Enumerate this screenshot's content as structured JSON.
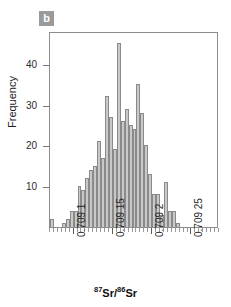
{
  "panel": {
    "letter": "b",
    "badge_color": "#9a9a9a"
  },
  "chart_data": {
    "type": "bar",
    "title": "",
    "subtitle": "",
    "xlabel": "87Sr/86Sr",
    "xlabel_parts": {
      "sup1": "87",
      "base1": "Sr/",
      "sup2": "86",
      "base2": "Sr"
    },
    "ylabel": "Frequency",
    "ylim": [
      0,
      48
    ],
    "xlim": [
      0.70907,
      0.709285
    ],
    "bin_width": 5e-06,
    "grid": false,
    "legend": null,
    "bar_color": "#c9c9c9",
    "bar_edge_color": "#8a8a8a",
    "yticks": [
      10,
      20,
      30,
      40
    ],
    "ytick_labels": [
      "10",
      "20",
      "30",
      "40"
    ],
    "xticks": [
      0.7091,
      0.70915,
      0.7092,
      0.70925
    ],
    "xtick_labels": [
      "0.709 1",
      "0.709 15",
      "0.709 2",
      "0.709 25"
    ],
    "categories": [
      "0.709070",
      "0.709075",
      "0.709080",
      "0.709085",
      "0.709090",
      "0.709095",
      "0.709100",
      "0.709105",
      "0.709110",
      "0.709115",
      "0.709120",
      "0.709125",
      "0.709130",
      "0.709135",
      "0.709140",
      "0.709145",
      "0.709150",
      "0.709155",
      "0.709160",
      "0.709165",
      "0.709170",
      "0.709175",
      "0.709180",
      "0.709185",
      "0.709190",
      "0.709195",
      "0.709200",
      "0.709205",
      "0.709210",
      "0.709215",
      "0.709220",
      "0.709225",
      "0.709230",
      "0.709235",
      "0.709240",
      "0.709245",
      "0.709250",
      "0.709255",
      "0.709260",
      "0.709265",
      "0.709270",
      "0.709275",
      "0.709280"
    ],
    "values": [
      2,
      0,
      0,
      1,
      2,
      4,
      4,
      10,
      9,
      12,
      14,
      15,
      21,
      17,
      32,
      27,
      19,
      45,
      26,
      29,
      25,
      24,
      35,
      28,
      20,
      13,
      8,
      8,
      3,
      11,
      4,
      4,
      1,
      0,
      0,
      0,
      0,
      0,
      0,
      0,
      0,
      0,
      0
    ],
    "peak_value": 45,
    "peak_category": "0.709155"
  },
  "axes": {
    "y_title": "Frequency",
    "y_ticks": [
      {
        "label": "10",
        "value": 10
      },
      {
        "label": "20",
        "value": 20
      },
      {
        "label": "30",
        "value": 30
      },
      {
        "label": "40",
        "value": 40
      }
    ],
    "x_ticks": [
      {
        "label": "0.709 1",
        "value": 0.7091
      },
      {
        "label": "0.709 15",
        "value": 0.70915
      },
      {
        "label": "0.709 2",
        "value": 0.7092
      },
      {
        "label": "0.709 25",
        "value": 0.70925
      }
    ]
  }
}
